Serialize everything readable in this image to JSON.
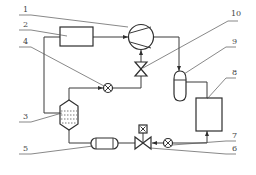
{
  "diagram": {
    "type": "refrigeration-system-schematic",
    "labels": {
      "l1": "1",
      "l2": "2",
      "l3": "3",
      "l4": "4",
      "l5": "5",
      "l6": "6",
      "l7": "7",
      "l8": "8",
      "l9": "9",
      "l10": "10"
    },
    "components": [
      {
        "id": "1",
        "name": "compressor",
        "shape": "circle-with-diagonals"
      },
      {
        "id": "2",
        "name": "rectangular-unit",
        "shape": "rectangle"
      },
      {
        "id": "3",
        "name": "separator-vessel",
        "shape": "hexagon-with-liquid"
      },
      {
        "id": "4",
        "name": "sight-glass",
        "shape": "circle-with-x"
      },
      {
        "id": "5",
        "name": "receiver-drier",
        "shape": "capsule"
      },
      {
        "id": "6",
        "name": "solenoid-valve",
        "shape": "bowtie-with-coil"
      },
      {
        "id": "7",
        "name": "sight-glass",
        "shape": "circle-with-x"
      },
      {
        "id": "8",
        "name": "rectangular-unit",
        "shape": "rectangle"
      },
      {
        "id": "9",
        "name": "vessel",
        "shape": "rounded-capsule-vertical"
      },
      {
        "id": "10",
        "name": "valve",
        "shape": "bowtie-vertical"
      }
    ],
    "colors": {
      "line": "#3a3a3a",
      "background": "#ffffff"
    }
  }
}
